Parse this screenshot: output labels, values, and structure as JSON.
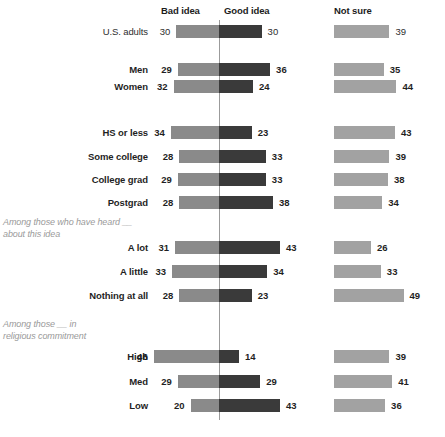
{
  "headers": {
    "bad": "Bad idea",
    "good": "Good idea",
    "notsure": "Not sure"
  },
  "notes": {
    "awareness": "Among those who have heard __\nabout this idea",
    "religion": "Among those __ in\nreligious commitment"
  },
  "colors": {
    "bad": "#8a8a8a",
    "good": "#3a3a3a",
    "notsure": "#a2a2a2",
    "axis": "#9b9b9b",
    "note_text": "#9a9a9a"
  },
  "chart_data": {
    "type": "bar",
    "title": "",
    "subtitle": "",
    "xlabel": "",
    "ylabel": "",
    "grid": false,
    "legend_position": "top",
    "orientation": "horizontal-diverging",
    "axis_center_value": 0,
    "units": "percent",
    "series": [
      {
        "name": "Bad idea",
        "direction": "left"
      },
      {
        "name": "Good idea",
        "direction": "right"
      },
      {
        "name": "Not sure",
        "direction": "separate"
      }
    ],
    "categories": [
      "U.S. adults",
      "Men",
      "Women",
      "HS or less",
      "Some college",
      "College grad",
      "Postgrad",
      "A lot",
      "A little",
      "Nothing at all",
      "High",
      "Med",
      "Low"
    ],
    "bad_idea": [
      30,
      29,
      32,
      34,
      28,
      29,
      28,
      31,
      33,
      28,
      46,
      29,
      20
    ],
    "good_idea": [
      30,
      36,
      24,
      23,
      33,
      33,
      38,
      43,
      34,
      23,
      14,
      29,
      43
    ],
    "not_sure": [
      39,
      35,
      44,
      43,
      39,
      38,
      34,
      26,
      33,
      49,
      39,
      41,
      36
    ]
  },
  "rows": [
    {
      "label": "U.S. adults",
      "bold": false,
      "bad": 30,
      "good": 30,
      "notsure": 39,
      "y": 25
    },
    {
      "label": "Men",
      "bold": true,
      "bad": 29,
      "good": 36,
      "notsure": 35,
      "y": 63
    },
    {
      "label": "Women",
      "bold": true,
      "bad": 32,
      "good": 24,
      "notsure": 44,
      "y": 80
    },
    {
      "label": "HS or less",
      "bold": true,
      "bad": 34,
      "good": 23,
      "notsure": 43,
      "y": 126
    },
    {
      "label": "Some college",
      "bold": true,
      "bad": 28,
      "good": 33,
      "notsure": 39,
      "y": 150
    },
    {
      "label": "College grad",
      "bold": true,
      "bad": 29,
      "good": 33,
      "notsure": 38,
      "y": 173
    },
    {
      "label": "Postgrad",
      "bold": true,
      "bad": 28,
      "good": 38,
      "notsure": 34,
      "y": 196
    },
    {
      "label": "A lot",
      "bold": true,
      "bad": 31,
      "good": 43,
      "notsure": 26,
      "y": 241
    },
    {
      "label": "A little",
      "bold": true,
      "bad": 33,
      "good": 34,
      "notsure": 33,
      "y": 265
    },
    {
      "label": "Nothing at all",
      "bold": true,
      "bad": 28,
      "good": 23,
      "notsure": 49,
      "y": 289
    },
    {
      "label": "High",
      "bold": true,
      "bad": 46,
      "good": 14,
      "notsure": 39,
      "y": 350
    },
    {
      "label": "Med",
      "bold": true,
      "bad": 29,
      "good": 29,
      "notsure": 41,
      "y": 375
    },
    {
      "label": "Low",
      "bold": true,
      "bad": 20,
      "good": 43,
      "notsure": 36,
      "y": 399
    }
  ],
  "geometry": {
    "axis_x": 219,
    "axis_top": 20,
    "axis_bottom": 420,
    "px_per_unit": 1.42,
    "notsure_x": 334,
    "notsure_px_per_unit": 1.42,
    "header_bad_x": 161,
    "header_good_x": 224,
    "header_notsure_x": 334,
    "header_y": 5,
    "note_awareness_y": 217,
    "note_religion_y": 319,
    "note_x": 3
  }
}
